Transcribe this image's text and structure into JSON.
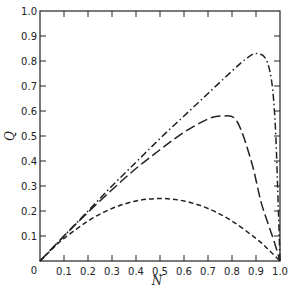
{
  "chart_data": {
    "type": "line",
    "title": "",
    "xlabel": "N",
    "ylabel": "Q",
    "xlim": [
      0,
      1.0
    ],
    "ylim": [
      0,
      1.0
    ],
    "grid": false,
    "legend": null,
    "x_ticks": [
      "0.1",
      "0.2",
      "0.3",
      "0.4",
      "0.5",
      "0.6",
      "0.7",
      "0.8",
      "0.9",
      "1.0"
    ],
    "x_origin_label": "0",
    "y_ticks": [
      "0",
      "0.1",
      "0.2",
      "0.3",
      "0.4",
      "0.5",
      "0.6",
      "0.7",
      "0.8",
      "0.9",
      "1.0"
    ],
    "series": [
      {
        "name": "short-dash curve",
        "style": "dashed",
        "dasharray": "5,3",
        "x": [
          0,
          0.05,
          0.1,
          0.2,
          0.3,
          0.4,
          0.5,
          0.6,
          0.7,
          0.8,
          0.9,
          0.95,
          1.0
        ],
        "y": [
          0,
          0.0475,
          0.09,
          0.16,
          0.21,
          0.24,
          0.25,
          0.24,
          0.21,
          0.16,
          0.09,
          0.0475,
          0
        ]
      },
      {
        "name": "long-dash curve",
        "style": "long-dashed",
        "dasharray": "10,4",
        "x": [
          0,
          0.1,
          0.2,
          0.3,
          0.4,
          0.5,
          0.6,
          0.7,
          0.76,
          0.82,
          0.88,
          0.92,
          0.95,
          0.975,
          1.0
        ],
        "y": [
          0,
          0.1,
          0.195,
          0.285,
          0.37,
          0.445,
          0.515,
          0.568,
          0.58,
          0.56,
          0.4,
          0.24,
          0.15,
          0.08,
          0
        ]
      },
      {
        "name": "dash-dot curve",
        "style": "dash-dot",
        "dasharray": "7,3,1.5,3",
        "x": [
          0,
          0.1,
          0.2,
          0.3,
          0.4,
          0.5,
          0.6,
          0.7,
          0.8,
          0.86,
          0.9,
          0.94,
          0.965,
          0.98,
          0.99,
          1.0
        ],
        "y": [
          0,
          0.1,
          0.2,
          0.3,
          0.395,
          0.49,
          0.58,
          0.67,
          0.76,
          0.81,
          0.83,
          0.81,
          0.72,
          0.55,
          0.3,
          0
        ]
      }
    ]
  },
  "axes": {
    "x_label": "N",
    "y_label": "Q"
  }
}
